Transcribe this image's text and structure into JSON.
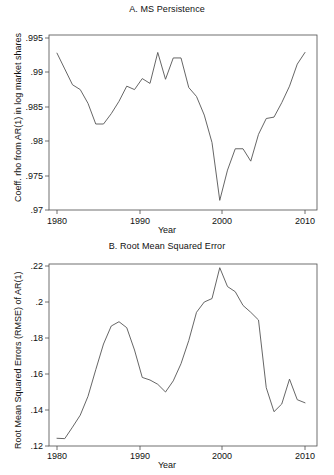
{
  "figure": {
    "background": "#ffffff",
    "line_color": "#555555",
    "axis_color": "#4d4d4d"
  },
  "panels": [
    {
      "id": "panel-a",
      "title": "A. MS Persistence",
      "ylabel": "Coeff. rho from AR(1) in log market shares",
      "xlabel": "Year"
    },
    {
      "id": "panel-b",
      "title": "B. Root Mean Squared Error",
      "ylabel": "Root Mean Squared Errors (RMSE) of AR(1)",
      "xlabel": "Year"
    }
  ],
  "chart_data": [
    {
      "type": "line",
      "title": "A. MS Persistence",
      "xlabel": "Year",
      "ylabel": "Coeff. rho from AR(1) in log market shares",
      "xlim": [
        1980,
        2012
      ],
      "ylim": [
        0.97,
        0.995
      ],
      "xticks": [
        1980,
        1990,
        2000,
        2010
      ],
      "xticklabels": [
        "1980",
        "1990",
        "2000",
        "2010"
      ],
      "yticks": [
        0.97,
        0.975,
        0.98,
        0.985,
        0.99,
        0.995
      ],
      "yticklabels": [
        ".97",
        ".975",
        ".98",
        ".985",
        ".99",
        ".995"
      ],
      "grid": false,
      "legend": "none",
      "x": [
        1980,
        1981,
        1982,
        1983,
        1984,
        1985,
        1986,
        1987,
        1988,
        1989,
        1990,
        1991,
        1992,
        1993,
        1994,
        1995,
        1996,
        1997,
        1998,
        1999,
        2000,
        2001,
        2002,
        2003,
        2004,
        2005,
        2006,
        2007,
        2008,
        2009,
        2010,
        2011,
        2012
      ],
      "values": [
        0.9928,
        0.9905,
        0.9882,
        0.9875,
        0.9855,
        0.9825,
        0.9825,
        0.984,
        0.9858,
        0.988,
        0.9875,
        0.9891,
        0.9884,
        0.9929,
        0.989,
        0.9921,
        0.9921,
        0.9878,
        0.9865,
        0.9838,
        0.9798,
        0.9714,
        0.9758,
        0.9789,
        0.9789,
        0.9771,
        0.981,
        0.9833,
        0.9835,
        0.9856,
        0.988,
        0.9912,
        0.9929
      ]
    },
    {
      "type": "line",
      "title": "B. Root Mean Squared Error",
      "xlabel": "Year",
      "ylabel": "Root Mean Squared Errors (RMSE) of AR(1)",
      "xlim": [
        1980,
        2012
      ],
      "ylim": [
        0.12,
        0.225
      ],
      "xticks": [
        1980,
        1990,
        2000,
        2010
      ],
      "xticklabels": [
        "1980",
        "1990",
        "2000",
        "2010"
      ],
      "yticks": [
        0.12,
        0.14,
        0.16,
        0.18,
        0.2,
        0.22
      ],
      "yticklabels": [
        ".12",
        ".14",
        ".16",
        ".18",
        ".2",
        ".22"
      ],
      "grid": false,
      "legend": "none",
      "x": [
        1980,
        1981,
        1982,
        1983,
        1984,
        1985,
        1986,
        1987,
        1988,
        1989,
        1990,
        1991,
        1992,
        1993,
        1994,
        1995,
        1996,
        1997,
        1998,
        1999,
        2000,
        2001,
        2002,
        2003,
        2004,
        2005,
        2006,
        2007,
        2008,
        2009,
        2010,
        2011,
        2012
      ],
      "values": [
        0.1245,
        0.1243,
        0.131,
        0.138,
        0.149,
        0.1645,
        0.1795,
        0.19,
        0.1925,
        0.189,
        0.176,
        0.16,
        0.1585,
        0.156,
        0.1515,
        0.158,
        0.168,
        0.1815,
        0.198,
        0.204,
        0.206,
        0.224,
        0.213,
        0.21,
        0.202,
        0.198,
        0.1935,
        0.154,
        0.14,
        0.1445,
        0.159,
        0.147,
        0.1452,
        0.1462,
        0.1475
      ]
    }
  ]
}
